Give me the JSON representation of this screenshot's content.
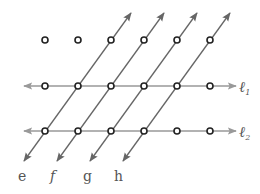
{
  "diagram": {
    "colors": {
      "line": "#666666",
      "horizontal_line": "#999999",
      "point_stroke": "#222222",
      "label": "#555555"
    },
    "horizontal_lines": [
      {
        "id": "l1",
        "label": "ℓ",
        "subscript": "1",
        "y": 86
      },
      {
        "id": "l2",
        "label": "ℓ",
        "subscript": "2",
        "y": 131
      }
    ],
    "transversals": [
      {
        "id": "e",
        "label": "e"
      },
      {
        "id": "f",
        "label": "f"
      },
      {
        "id": "g",
        "label": "g"
      },
      {
        "id": "h",
        "label": "h"
      }
    ],
    "points": {
      "top_row_count": 6,
      "l1_row_count": 6,
      "l2_row_count": 6
    }
  }
}
